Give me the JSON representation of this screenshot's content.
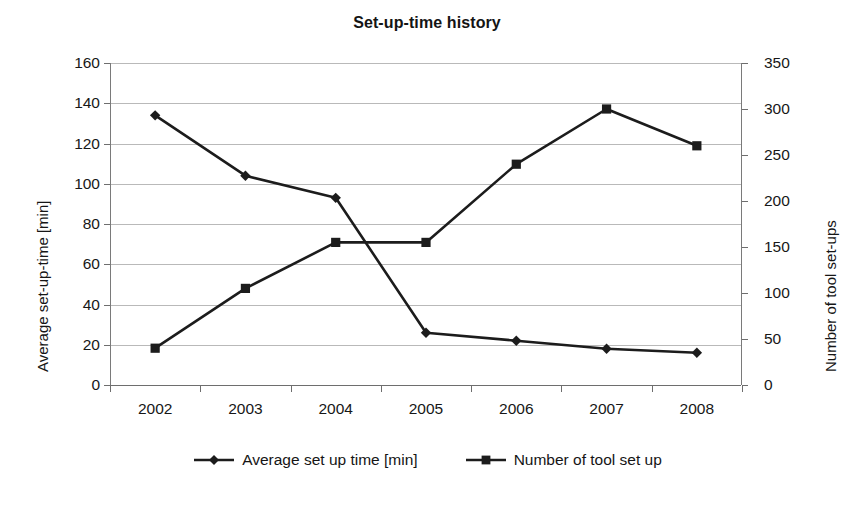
{
  "chart_data": {
    "type": "line",
    "title": "Set-up-time history",
    "xlabel": "",
    "categories": [
      "2002",
      "2003",
      "2004",
      "2005",
      "2006",
      "2007",
      "2008"
    ],
    "grid": true,
    "legend_position": "bottom",
    "series": [
      {
        "name": "Average set up time [min]",
        "axis": "left",
        "marker": "diamond",
        "color": "#1c1c1c",
        "values": [
          134,
          104,
          93,
          26,
          22,
          18,
          16
        ]
      },
      {
        "name": "Number of tool set up",
        "axis": "right",
        "marker": "square",
        "color": "#1c1c1c",
        "values": [
          40,
          105,
          155,
          155,
          240,
          300,
          260
        ]
      }
    ],
    "left_axis": {
      "label": "Average set-up-time [min]",
      "ticks": [
        "0",
        "20",
        "40",
        "60",
        "80",
        "100",
        "120",
        "140",
        "160"
      ],
      "ylim": [
        0,
        160
      ]
    },
    "right_axis": {
      "label": "Number of tool set-ups",
      "ticks": [
        "0",
        "50",
        "100",
        "150",
        "200",
        "250",
        "300",
        "350"
      ],
      "ylim": [
        0,
        350
      ]
    }
  },
  "legend": {
    "entries": [
      {
        "label": "Average set up time [min]",
        "marker": "diamond-marker"
      },
      {
        "label": "Number of tool set up",
        "marker": "square-marker"
      }
    ]
  }
}
